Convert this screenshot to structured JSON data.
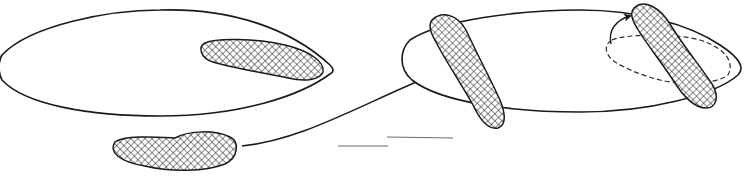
{
  "diagram": {
    "type": "schematic line drawing",
    "colors": {
      "stroke": "#1a1a1a",
      "background": "#ffffff",
      "hatch": "#1a1a1a"
    },
    "panels": [
      {
        "id": "left",
        "elements": [
          "large elongated oval cell",
          "cross-hatched elongated body inside right end of oval",
          "cross-hatched elongated body below oval (outside)"
        ]
      },
      {
        "id": "right",
        "elements": [
          "elongated oval cell",
          "cross-hatched elongated body crossing left end of oval",
          "cross-hatched elongated body crossing right end of oval",
          "dashed loop inside right end with curved arrow"
        ]
      }
    ],
    "connectors": [
      {
        "from": "left lower hatched body",
        "to": "right oval left end",
        "style": "curved arrow, filled arrowhead"
      }
    ],
    "extra_marks": [
      "two short faint horizontal line segments between panels"
    ],
    "labels": []
  }
}
